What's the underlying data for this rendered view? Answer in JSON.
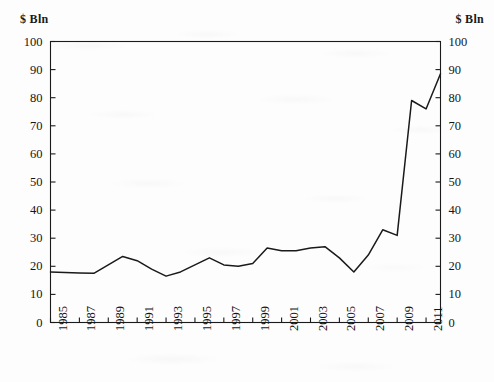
{
  "figure": {
    "background_color": "#fdfdfd",
    "line_color": "#1a1a1a",
    "axis_color": "#1a1a1a"
  },
  "axes": {
    "left_unit_label": "$ Bln",
    "right_unit_label": "$ Bln",
    "y_ticks": [
      "0",
      "10",
      "20",
      "30",
      "40",
      "50",
      "60",
      "70",
      "80",
      "90",
      "100"
    ],
    "x_ticks": [
      "1985",
      "1987",
      "1989",
      "1991",
      "1993",
      "1995",
      "1997",
      "1999",
      "2001",
      "2003",
      "2005",
      "2007",
      "2009",
      "2011"
    ]
  },
  "chart_data": {
    "type": "line",
    "title": "",
    "subtitle": "",
    "xlabel": "",
    "ylabel": "$ Bln",
    "y2label": "$ Bln",
    "xlim": [
      1985,
      2012
    ],
    "ylim": [
      0,
      100
    ],
    "ytick_interval": 10,
    "xtick_interval": 2,
    "grid": false,
    "legend": null,
    "legend_position": "none",
    "annotations": [],
    "x": [
      1985,
      1986,
      1987,
      1988,
      1989,
      1990,
      1991,
      1992,
      1993,
      1994,
      1995,
      1996,
      1997,
      1998,
      1999,
      2000,
      2001,
      2002,
      2003,
      2004,
      2005,
      2006,
      2007,
      2008,
      2009,
      2010,
      2011,
      2012
    ],
    "series": [
      {
        "name": "value",
        "values": [
          18,
          17.8,
          17.6,
          17.5,
          20.5,
          23.5,
          22,
          19,
          16.5,
          18,
          20.5,
          23,
          20.5,
          20,
          21,
          26.5,
          25.5,
          25.5,
          26.5,
          27,
          23,
          18,
          24,
          33,
          31,
          79,
          76,
          88.5
        ]
      }
    ]
  }
}
